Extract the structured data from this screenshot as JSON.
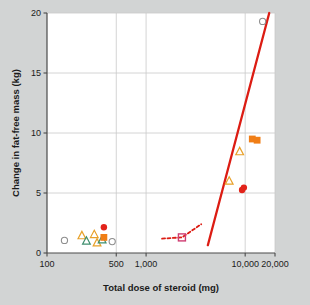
{
  "chart_data": {
    "type": "scatter",
    "title": "",
    "xlabel": "Total dose of steroid (mg)",
    "ylabel": "Change in fat-free mass (kg)",
    "xscale": "log",
    "yscale": "linear",
    "xlim": [
      100,
      20000
    ],
    "ylim": [
      0,
      20
    ],
    "xticks": [
      100,
      500,
      1000,
      10000,
      20000
    ],
    "xtick_labels": [
      "100",
      "500",
      "1,000",
      "10,000",
      "20,000"
    ],
    "yticks": [
      0,
      5,
      10,
      15,
      20
    ],
    "ytick_labels": [
      "0",
      "5",
      "10",
      "15",
      "20"
    ],
    "grid": "both",
    "legend": "none",
    "points": [
      {
        "x": 150,
        "y": 1.05,
        "marker": "circle-open",
        "color": "#8e8e8e"
      },
      {
        "x": 225,
        "y": 1.45,
        "marker": "triangle-open",
        "color": "#e8a12a"
      },
      {
        "x": 250,
        "y": 1.0,
        "marker": "triangle-open",
        "color": "#3f8f6f"
      },
      {
        "x": 300,
        "y": 1.55,
        "marker": "triangle-open",
        "color": "#e8a12a"
      },
      {
        "x": 320,
        "y": 0.85,
        "marker": "triangle-open",
        "color": "#e8a12a"
      },
      {
        "x": 360,
        "y": 1.1,
        "marker": "triangle-open",
        "color": "#3f8f6f"
      },
      {
        "x": 375,
        "y": 2.15,
        "marker": "circle-filled",
        "color": "#e2231a"
      },
      {
        "x": 375,
        "y": 1.3,
        "marker": "square-filled",
        "color": "#f07e16"
      },
      {
        "x": 455,
        "y": 0.95,
        "marker": "circle-open",
        "color": "#8e8e8e"
      },
      {
        "x": 2300,
        "y": 1.3,
        "marker": "square-open",
        "color": "#cf3d72"
      },
      {
        "x": 6900,
        "y": 6.0,
        "marker": "triangle-open",
        "color": "#e8a12a"
      },
      {
        "x": 8800,
        "y": 8.45,
        "marker": "triangle-open",
        "color": "#e8a12a"
      },
      {
        "x": 9300,
        "y": 5.25,
        "marker": "circle-filled",
        "color": "#e2231a"
      },
      {
        "x": 9700,
        "y": 5.45,
        "marker": "circle-filled",
        "color": "#e2231a"
      },
      {
        "x": 11800,
        "y": 9.5,
        "marker": "square-filled",
        "color": "#f07e16"
      },
      {
        "x": 13200,
        "y": 9.4,
        "marker": "square-filled",
        "color": "#f07e16"
      },
      {
        "x": 15000,
        "y": 19.3,
        "marker": "circle-open",
        "color": "#8e8e8e"
      }
    ],
    "fit_line": {
      "color": "#dc1c13",
      "solid": [
        {
          "x": 4200,
          "y": 0.65
        },
        {
          "x": 17500,
          "y": 20.0
        }
      ],
      "dashed": [
        {
          "x": 1450,
          "y": 1.2
        },
        {
          "x": 2300,
          "y": 1.3
        },
        {
          "x": 3600,
          "y": 2.4
        }
      ]
    }
  },
  "colors": {
    "background": "#d2d4d4",
    "plot_background": "#ffffff",
    "grid": "#c9c9c9",
    "axis": "#4a4a4a",
    "fit_line": "#dc1c13",
    "open_circle": "#8e8e8e",
    "orange_triangle": "#e8a12a",
    "green_triangle": "#3f8f6f",
    "red_circle": "#e2231a",
    "orange_square": "#f07e16",
    "open_square": "#cf3d72"
  }
}
